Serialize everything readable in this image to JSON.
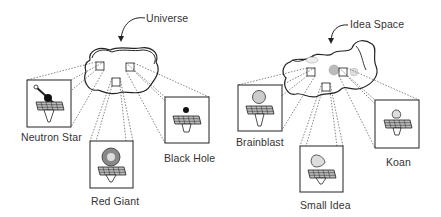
{
  "left_diagram": {
    "title": "Universe",
    "items": [
      {
        "label": "Neutron Star",
        "icon": "neutron-star-icon"
      },
      {
        "label": "Red Giant",
        "icon": "red-giant-icon"
      },
      {
        "label": "Black Hole",
        "icon": "black-hole-icon"
      }
    ]
  },
  "right_diagram": {
    "title": "Idea Space",
    "items": [
      {
        "label": "Brainblast",
        "icon": "brainblast-icon"
      },
      {
        "label": "Small Idea",
        "icon": "small-idea-icon"
      },
      {
        "label": "Koan",
        "icon": "koan-icon"
      }
    ]
  },
  "colors": {
    "stroke": "#222222",
    "text": "#333333",
    "panel_fill": "#999999"
  }
}
